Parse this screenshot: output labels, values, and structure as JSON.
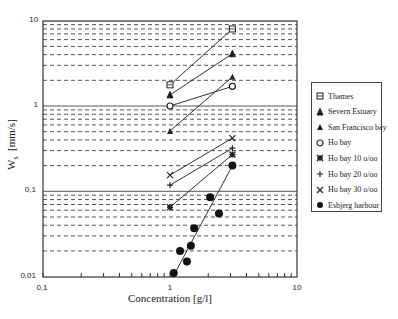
{
  "chart_data": {
    "type": "scatter",
    "title": "",
    "xlabel": "Concentration [g/l]",
    "ylabel": "Ws [mm/s]",
    "xscale": "log",
    "yscale": "log",
    "xlim": [
      0.1,
      10
    ],
    "ylim": [
      0.01,
      10
    ],
    "x_ticks": [
      "0,1",
      "1",
      "10"
    ],
    "y_ticks": [
      "0,01",
      "0,1",
      "1",
      "10"
    ],
    "grid": "horizontal dashed at minor log ticks, solid at decades",
    "legend_position": "right, outside plot",
    "series": [
      {
        "name": "Thames",
        "marker": "square",
        "points": [
          [
            1.0,
            1.77
          ],
          [
            3.1,
            8.0
          ]
        ],
        "line": true
      },
      {
        "name": "Severn Estuary",
        "marker": "star",
        "points": [
          [
            1.0,
            1.35
          ],
          [
            3.1,
            4.1
          ]
        ],
        "line": true
      },
      {
        "name": "San Francisco bay",
        "marker": "triangle",
        "points": [
          [
            1.0,
            0.51
          ],
          [
            3.1,
            2.2
          ]
        ],
        "line": true
      },
      {
        "name": "Ho bay",
        "marker": "circle-open",
        "points": [
          [
            1.0,
            1.0
          ],
          [
            3.1,
            1.7
          ]
        ],
        "line": true
      },
      {
        "name": "Ho bay 10 o/oo",
        "marker": "asterisk",
        "points": [
          [
            1.0,
            0.065
          ],
          [
            3.1,
            0.27
          ]
        ],
        "line": true
      },
      {
        "name": "Ho bay 20 o/oo",
        "marker": "plus",
        "points": [
          [
            1.0,
            0.118
          ],
          [
            3.1,
            0.32
          ]
        ],
        "line": true
      },
      {
        "name": "Ho bay 30 o/oo",
        "marker": "x",
        "points": [
          [
            1.0,
            0.155
          ],
          [
            3.1,
            0.42
          ]
        ],
        "line": true
      },
      {
        "name": "Esbjerg harbour",
        "marker": "circle-filled",
        "points": [
          [
            1.07,
            0.011
          ],
          [
            1.2,
            0.02
          ],
          [
            1.36,
            0.015
          ],
          [
            1.46,
            0.023
          ],
          [
            1.55,
            0.037
          ],
          [
            2.07,
            0.085
          ],
          [
            2.43,
            0.055
          ],
          [
            3.1,
            0.2
          ]
        ],
        "fit_line": [
          [
            1.05,
            0.0098
          ],
          [
            3.1,
            0.2
          ]
        ]
      }
    ]
  },
  "axes": {
    "xlabel": "Concentration [g/l]",
    "ylabel_main": "W",
    "ylabel_sub": "s",
    "ylabel_unit": "[mm/s]"
  },
  "legend": {
    "items": [
      {
        "label": "Thames",
        "marker": "square"
      },
      {
        "label": "Severn Estuary",
        "marker": "star"
      },
      {
        "label": "San Francisco bay",
        "marker": "triangle"
      },
      {
        "label": "Ho bay",
        "marker": "circle-open"
      },
      {
        "label": "Ho bay 10 o/oo",
        "marker": "asterisk"
      },
      {
        "label": "Ho bay 20 o/oo",
        "marker": "plus"
      },
      {
        "label": "Ho bay 30 o/oo",
        "marker": "x"
      },
      {
        "label": "Esbjerg harbour",
        "marker": "circle-filled"
      }
    ]
  }
}
